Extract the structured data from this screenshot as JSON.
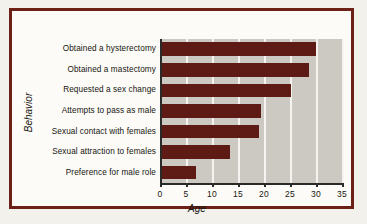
{
  "chart_data": {
    "type": "bar",
    "orientation": "horizontal",
    "title": "",
    "xlabel": "Age",
    "ylabel": "Behavior",
    "categories": [
      "Obtained a hysterectomy",
      "Obtained a mastectomy",
      "Requested a sex change",
      "Attempts to pass as male",
      "Sexual contact with females",
      "Sexual attraction to females",
      "Preference for male role"
    ],
    "values": [
      30,
      28.7,
      25.2,
      19.5,
      19,
      13.5,
      7
    ],
    "xlim": [
      0,
      35
    ],
    "xticks": [
      0,
      5,
      10,
      15,
      20,
      25,
      30,
      35
    ],
    "xtick_labels": [
      "0",
      "5",
      "10",
      "15",
      "20",
      "25",
      "30",
      "35"
    ],
    "grid": "vertical-white",
    "legend": "none",
    "bar_color": "#5e1a14",
    "plot_background": "#cbc9c2",
    "frame_color": "#6b2018"
  }
}
